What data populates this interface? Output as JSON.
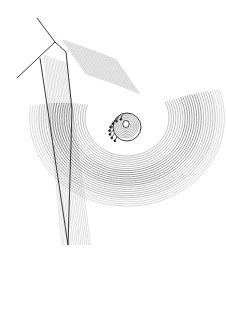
{
  "illustration": {
    "subject": "anatomical line engraving",
    "background": "#ffffff",
    "ink": "#222222",
    "width": 226,
    "height": 312
  }
}
